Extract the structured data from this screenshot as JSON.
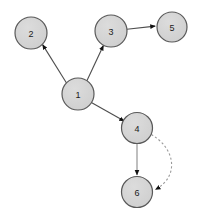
{
  "graph": {
    "title": "",
    "background_color": "#ffffff",
    "canvas": {
      "width": 201,
      "height": 223
    },
    "node_style": {
      "fill_color": "#d4d4d4",
      "stroke_color": "#595959",
      "label_color": "#1a1a1a",
      "radius": 15.5
    },
    "edge_style": {
      "stroke_color": "#4d4d4d",
      "dashed_stroke_color": "#8c8c8c",
      "arrow_color": "#111111"
    },
    "nodes": [
      {
        "id": "1",
        "label": "1",
        "cx": 78,
        "cy": 94,
        "r": 16
      },
      {
        "id": "2",
        "label": "2",
        "cx": 31,
        "cy": 33,
        "r": 16
      },
      {
        "id": "3",
        "label": "3",
        "cx": 111,
        "cy": 31,
        "r": 16
      },
      {
        "id": "4",
        "label": "4",
        "cx": 137,
        "cy": 128,
        "r": 15.5
      },
      {
        "id": "5",
        "label": "5",
        "cx": 172,
        "cy": 27,
        "r": 15
      },
      {
        "id": "6",
        "label": "6",
        "cx": 137,
        "cy": 192,
        "r": 15.5
      }
    ],
    "edges": [
      {
        "id": "e1",
        "from": "1",
        "to": "2",
        "style": "solid",
        "arrow": true,
        "curved": false
      },
      {
        "id": "e2",
        "from": "1",
        "to": "3",
        "style": "solid",
        "arrow": true,
        "curved": false
      },
      {
        "id": "e3",
        "from": "1",
        "to": "4",
        "style": "solid",
        "arrow": true,
        "curved": false
      },
      {
        "id": "e4",
        "from": "3",
        "to": "5",
        "style": "solid",
        "arrow": true,
        "curved": false
      },
      {
        "id": "e5",
        "from": "4",
        "to": "6",
        "style": "solid",
        "arrow": true,
        "curved": false
      },
      {
        "id": "e6",
        "from": "4",
        "to": "6",
        "style": "dashed",
        "arrow": true,
        "curved": true
      }
    ]
  }
}
